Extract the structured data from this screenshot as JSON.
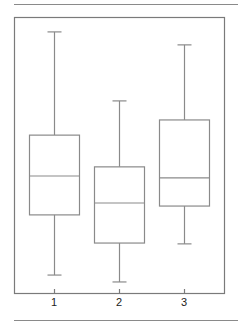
{
  "chart_data": {
    "type": "box",
    "title": "",
    "xlabel": "",
    "ylabel": "",
    "categories": [
      "1",
      "2",
      "3"
    ],
    "y_axis_visible": false,
    "ylim": [
      0,
      100
    ],
    "note": "No y-axis shown; values estimated on a normalized 0-100 scale spanning the plot frame.",
    "series": [
      {
        "name": "1",
        "min": 6.5,
        "q1": 28.3,
        "median": 42.4,
        "q3": 57.2,
        "max": 94.6
      },
      {
        "name": "2",
        "min": 4.0,
        "q1": 18.1,
        "median": 32.6,
        "q3": 45.7,
        "max": 69.6
      },
      {
        "name": "3",
        "min": 17.8,
        "q1": 31.5,
        "median": 41.7,
        "q3": 62.7,
        "max": 89.9
      }
    ],
    "grid": false,
    "legend": null,
    "colors": {
      "stroke": "#8a8a8a",
      "frame": "#7a7a7a",
      "fill": "#ffffff"
    }
  },
  "axis": {
    "tick_labels": [
      "1",
      "2",
      "3"
    ]
  }
}
